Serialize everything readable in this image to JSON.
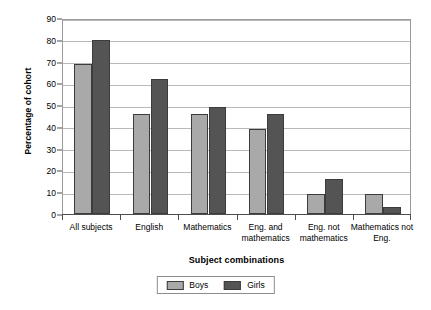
{
  "chart_data": {
    "type": "bar",
    "title": "",
    "xlabel": "Subject combinations",
    "ylabel": "Percentage of cohort",
    "categories": [
      "All subjects",
      "English",
      "Mathematics",
      "Eng. and mathematics",
      "Eng. not mathematics",
      "Mathematics not Eng."
    ],
    "series": [
      {
        "name": "Boys",
        "color": "#a9a9a9",
        "values": [
          69,
          46,
          46,
          39,
          9,
          9
        ]
      },
      {
        "name": "Girls",
        "color": "#545454",
        "values": [
          80,
          62,
          49,
          46,
          16,
          3
        ]
      }
    ],
    "ylim": [
      0,
      90
    ],
    "ytick_labels": [
      "90",
      "80",
      "70",
      "60",
      "50",
      "40",
      "30",
      "20",
      "10",
      "0"
    ],
    "ytick_values": [
      90,
      80,
      70,
      60,
      50,
      40,
      30,
      20,
      10,
      0
    ],
    "grid": true,
    "legend_position": "bottom"
  }
}
